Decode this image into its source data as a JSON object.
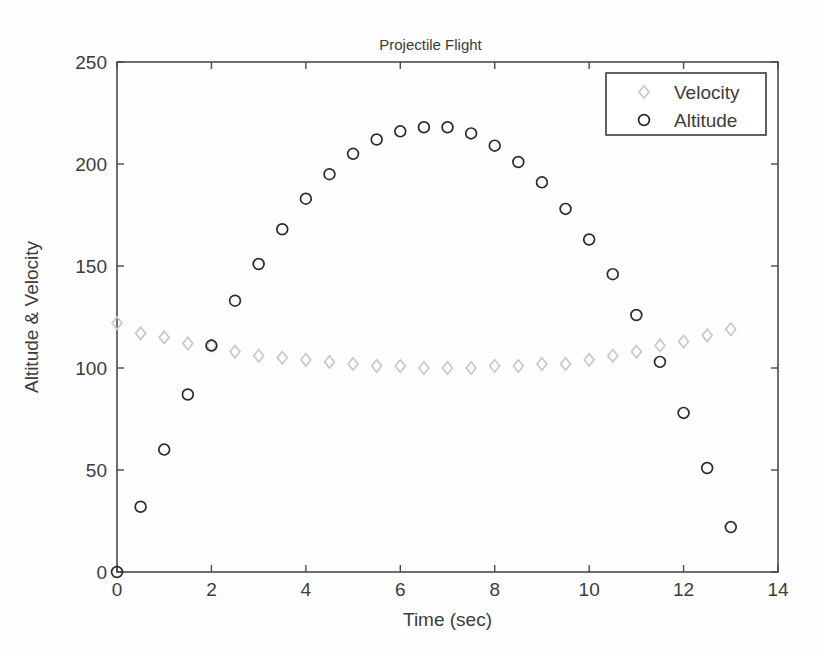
{
  "chart_data": {
    "type": "scatter",
    "title": "Projectile Flight",
    "xlabel": "Time (sec)",
    "ylabel": "Altitude & Velocity",
    "xlim": [
      0,
      14
    ],
    "ylim": [
      0,
      250
    ],
    "xticks": [
      "0",
      "2",
      "4",
      "6",
      "8",
      "10",
      "12",
      "14"
    ],
    "xtick_values": [
      0,
      2,
      4,
      6,
      8,
      10,
      12,
      14
    ],
    "yticks": [
      "0",
      "50",
      "100",
      "150",
      "200",
      "250"
    ],
    "ytick_values": [
      0,
      50,
      100,
      150,
      200,
      250
    ],
    "grid": false,
    "legend_position": "top-right",
    "x": [
      0,
      0.5,
      1,
      1.5,
      2,
      2.5,
      3,
      3.5,
      4,
      4.5,
      5,
      5.5,
      6,
      6.5,
      7,
      7.5,
      8,
      8.5,
      9,
      9.5,
      10,
      10.5,
      11,
      11.5,
      12,
      12.5,
      13
    ],
    "series": [
      {
        "name": "Velocity",
        "marker": "diamond",
        "color": "#c8c8c8",
        "values": [
          122,
          117,
          115,
          112,
          111,
          108,
          106,
          105,
          104,
          103,
          102,
          101,
          101,
          100,
          100,
          100,
          101,
          101,
          102,
          102,
          104,
          106,
          108,
          111,
          113,
          116,
          119
        ]
      },
      {
        "name": "Altitude",
        "marker": "circle",
        "color": "#2b2b2b",
        "values": [
          0,
          32,
          60,
          87,
          111,
          133,
          151,
          168,
          183,
          195,
          205,
          212,
          216,
          218,
          218,
          215,
          209,
          201,
          191,
          178,
          163,
          146,
          126,
          103,
          78,
          51,
          22
        ]
      }
    ]
  },
  "legend": {
    "items": [
      {
        "label": "Velocity",
        "marker": "diamond-icon"
      },
      {
        "label": "Altitude",
        "marker": "circle-icon"
      }
    ]
  }
}
